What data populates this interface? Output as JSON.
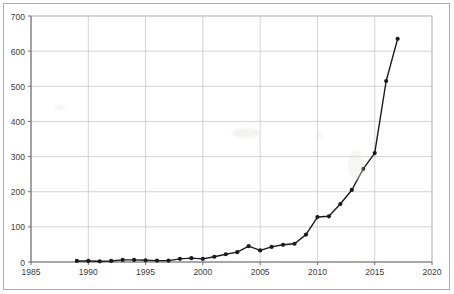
{
  "chart_data": {
    "type": "line",
    "title": "",
    "subtitle": "",
    "xlabel": "",
    "ylabel": "",
    "xlim": [
      1985,
      2020
    ],
    "ylim": [
      0,
      700
    ],
    "xticks": [
      1985,
      1990,
      1995,
      2000,
      2005,
      2010,
      2015,
      2020
    ],
    "yticks": [
      0,
      100,
      200,
      300,
      400,
      500,
      600,
      700
    ],
    "grid": true,
    "legend": null,
    "legend_position": "none",
    "marker": "circle-filled",
    "line_color": "#1a1a1a",
    "marker_color": "#1a1a1a",
    "grid_color": "#c8c8c8",
    "axis_color": "#808080",
    "x": [
      1989,
      1990,
      1991,
      1992,
      1993,
      1994,
      1995,
      1996,
      1997,
      1998,
      1999,
      2000,
      2001,
      2002,
      2003,
      2004,
      2005,
      2006,
      2007,
      2008,
      2009,
      2010,
      2011,
      2012,
      2013,
      2014,
      2015,
      2016,
      2017
    ],
    "values": [
      3,
      3,
      2,
      3,
      6,
      6,
      5,
      4,
      4,
      9,
      11,
      9,
      15,
      22,
      28,
      45,
      33,
      43,
      49,
      52,
      78,
      128,
      130,
      165,
      205,
      265,
      310,
      515,
      635
    ],
    "series": [
      {
        "name": "series-1",
        "values": [
          3,
          3,
          2,
          3,
          6,
          6,
          5,
          4,
          4,
          9,
          11,
          9,
          15,
          22,
          28,
          45,
          33,
          43,
          49,
          52,
          78,
          128,
          130,
          165,
          205,
          265,
          310,
          515,
          635
        ]
      }
    ]
  }
}
